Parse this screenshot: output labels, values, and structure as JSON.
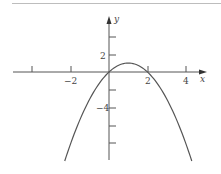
{
  "chart_data": {
    "type": "line",
    "title": "",
    "function": "y = 2x - x^2",
    "xlabel": "x",
    "ylabel": "y",
    "xlim": [
      -5.0,
      5.0
    ],
    "ylim": [
      -9.9,
      4.5
    ],
    "x_ticks": [
      -4,
      -2,
      2,
      4
    ],
    "x_tick_labels": [
      "",
      "-2",
      "2",
      "4"
    ],
    "y_ticks": [
      4,
      2,
      -2,
      -4,
      -6,
      -8
    ],
    "y_tick_labels": [
      "",
      "2",
      "",
      "-4",
      "",
      ""
    ],
    "grid": false,
    "legend": null,
    "series": [
      {
        "name": "parabola",
        "color": "#555555",
        "x": [
          -2.3,
          -2,
          -1,
          0,
          0.5,
          1,
          1.5,
          2,
          3,
          4,
          4.3
        ],
        "y": [
          -9.89,
          -8,
          -3,
          0,
          0.75,
          1,
          0.75,
          0,
          -3,
          -8,
          -9.89
        ]
      }
    ],
    "annotations": {
      "vertex": [
        1,
        1
      ],
      "roots": [
        0,
        2
      ]
    }
  },
  "labels": {
    "x_axis": "x",
    "y_axis": "y",
    "tick_neg2": "−2",
    "tick_2x": "2",
    "tick_4x": "4",
    "tick_2y": "2",
    "tick_neg4y": "−4"
  },
  "colors": {
    "axis": "#555555",
    "curve": "#555555",
    "top_rule": "#bdbdbd"
  }
}
